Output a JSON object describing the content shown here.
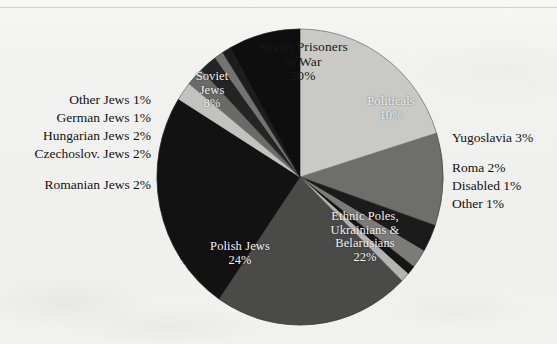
{
  "chart_data": {
    "type": "pie",
    "title": "",
    "legend_position": "none",
    "total_label_suffix": "%",
    "slices": [
      {
        "label": "Soviet Prisoners\nof War",
        "label_line1": "Soviet Prisoners",
        "label_line2": "of War",
        "value": 20,
        "value_label": "20%",
        "color": "#c9c9c6",
        "label_placement": "inside",
        "text_color": "dark"
      },
      {
        "label": "Politicals",
        "value": 10,
        "value_label": "10%",
        "color": "#6e6e6b",
        "label_placement": "inside",
        "text_color": "light"
      },
      {
        "label": "Yugoslavia",
        "value": 3,
        "value_label": "3%",
        "color": "#1b1b1b",
        "label_placement": "outside-right",
        "text_color": "dark"
      },
      {
        "label": "Roma",
        "value": 2,
        "value_label": "2%",
        "color": "#7b7b78",
        "label_placement": "outside-right",
        "text_color": "dark"
      },
      {
        "label": "Disabled",
        "value": 1,
        "value_label": "1%",
        "color": "#151515",
        "label_placement": "outside-right",
        "text_color": "dark"
      },
      {
        "label": "Other",
        "value": 1,
        "value_label": "1%",
        "color": "#b4b4b1",
        "label_placement": "outside-right",
        "text_color": "dark"
      },
      {
        "label": "Ethnic Poles,\nUkrainians &\nBelarusians",
        "label_line1": "Ethnic Poles,",
        "label_line2": "Ukrainians &",
        "label_line3": "Belarusians",
        "value": 22,
        "value_label": "22%",
        "color": "#4a4a48",
        "label_placement": "inside",
        "text_color": "light"
      },
      {
        "label": "Polish Jews",
        "value": 24,
        "value_label": "24%",
        "color": "#121212",
        "label_placement": "inside",
        "text_color": "light"
      },
      {
        "label": "Romanian Jews",
        "value": 2,
        "value_label": "2%",
        "color": "#c2c2bf",
        "label_placement": "outside-left",
        "text_color": "dark"
      },
      {
        "label": "Czechoslov. Jews",
        "value": 2,
        "value_label": "2%",
        "color": "#6a6a67",
        "label_placement": "outside-left",
        "text_color": "dark"
      },
      {
        "label": "Hungarian Jews",
        "value": 2,
        "value_label": "2%",
        "color": "#242424",
        "label_placement": "outside-left",
        "text_color": "dark"
      },
      {
        "label": "German Jews",
        "value": 1,
        "value_label": "1%",
        "color": "#737370",
        "label_placement": "outside-left",
        "text_color": "dark"
      },
      {
        "label": "Other Jews",
        "value": 1,
        "value_label": "1%",
        "color": "#1d1d1d",
        "label_placement": "outside-left",
        "text_color": "dark"
      },
      {
        "label": "Soviet\nJews",
        "label_line1": "Soviet",
        "label_line2": "Jews",
        "value": 8,
        "value_label": "8%",
        "color": "#0e0e0e",
        "label_placement": "inside",
        "text_color": "light"
      }
    ]
  },
  "inside_labels": {
    "soviet_pow": {
      "line1": "Soviet Prisoners",
      "line2": "of War",
      "value": "20%"
    },
    "politicals": {
      "line1": "Politicals",
      "value": "10%"
    },
    "ethnic_poles": {
      "line1": "Ethnic Poles,",
      "line2": "Ukrainians &",
      "line3": "Belarusians",
      "value": "22%"
    },
    "polish_jews": {
      "line1": "Polish Jews",
      "value": "24%"
    },
    "soviet_jews": {
      "line1": "Soviet",
      "line2": "Jews",
      "value": "8%"
    }
  },
  "outside_labels": {
    "other_jews": "Other Jews 1%",
    "german_jews": "German Jews 1%",
    "hungarian_jews": "Hungarian Jews 2%",
    "czechoslov_jews": "Czechoslov. Jews 2%",
    "romanian_jews": "Romanian Jews 2%",
    "yugoslavia": "Yugoslavia 3%",
    "roma": "Roma 2%",
    "disabled": "Disabled 1%",
    "other": "Other 1%"
  },
  "geometry": {
    "center_x": 300,
    "center_y": 177,
    "radius_x": 143,
    "radius_y": 148
  }
}
